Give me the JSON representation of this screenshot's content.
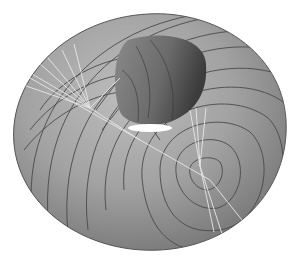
{
  "figure": {
    "colors": {
      "background": "#ffffff",
      "surface_light": "#b4b4b4",
      "surface_mid": "#979797",
      "surface_dark": "#6e6e6e",
      "hole_dark": "#5a5a5a",
      "contour": "#4a4a4a",
      "geodesic": "#e6e6e6",
      "highlight": "#ffffff"
    }
  }
}
